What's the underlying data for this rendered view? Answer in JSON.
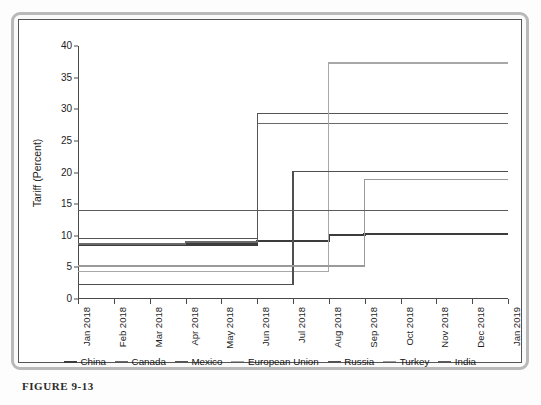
{
  "figure": {
    "caption": "FIGURE 9-13"
  },
  "chart_data": {
    "type": "line",
    "subtype": "step",
    "title": "",
    "xlabel": "",
    "ylabel": "Tariff (Percent)",
    "ylim": [
      0,
      40
    ],
    "yticks": [
      0,
      5,
      10,
      15,
      20,
      25,
      30,
      35,
      40
    ],
    "grid": false,
    "legend_position": "bottom",
    "categories": [
      "Jan 2018",
      "Feb 2018",
      "Mar 2018",
      "Apr 2018",
      "May 2018",
      "Jun 2018",
      "Jul 2018",
      "Aug 2018",
      "Sep 2018",
      "Oct 2018",
      "Nov 2018",
      "Dec 2018",
      "Jan 2019"
    ],
    "series": [
      {
        "name": "China",
        "color": "#3c3c3c",
        "width": 2.6,
        "values": [
          8.6,
          8.6,
          8.6,
          8.6,
          8.6,
          9.2,
          9.2,
          10.1,
          10.3,
          10.3,
          10.3,
          10.3,
          10.3
        ]
      },
      {
        "name": "Canada",
        "color": "#6a6a6a",
        "width": 1.3,
        "values": [
          8.7,
          8.7,
          8.7,
          9.0,
          9.0,
          27.8,
          27.8,
          27.8,
          27.8,
          27.8,
          27.8,
          27.8,
          27.8
        ]
      },
      {
        "name": "Mexico",
        "color": "#555555",
        "width": 1.3,
        "values": [
          9.6,
          9.6,
          9.6,
          9.6,
          9.6,
          29.3,
          29.3,
          29.3,
          29.3,
          29.3,
          29.3,
          29.3,
          29.3
        ]
      },
      {
        "name": "European Union",
        "color": "#a8a8a8",
        "width": 1.3,
        "values": [
          4.4,
          4.4,
          4.4,
          4.4,
          4.4,
          4.4,
          4.4,
          37.3,
          37.3,
          37.3,
          37.3,
          37.3,
          37.3
        ]
      },
      {
        "name": "Russia",
        "color": "#4f4f4f",
        "width": 1.3,
        "values": [
          2.3,
          2.3,
          2.3,
          2.3,
          2.3,
          2.3,
          20.2,
          20.2,
          20.2,
          20.2,
          20.2,
          20.2,
          20.2
        ]
      },
      {
        "name": "Turkey",
        "color": "#9a9a9a",
        "width": 1.3,
        "values": [
          5.2,
          5.2,
          5.2,
          5.2,
          5.2,
          5.2,
          5.2,
          5.2,
          18.9,
          18.9,
          18.9,
          18.9,
          18.9
        ]
      },
      {
        "name": "India",
        "color": "#5a5a5a",
        "width": 1.3,
        "values": [
          14.0,
          14.0,
          14.0,
          14.0,
          14.0,
          14.0,
          14.0,
          14.0,
          14.0,
          14.0,
          14.0,
          14.0,
          14.0
        ]
      }
    ]
  }
}
